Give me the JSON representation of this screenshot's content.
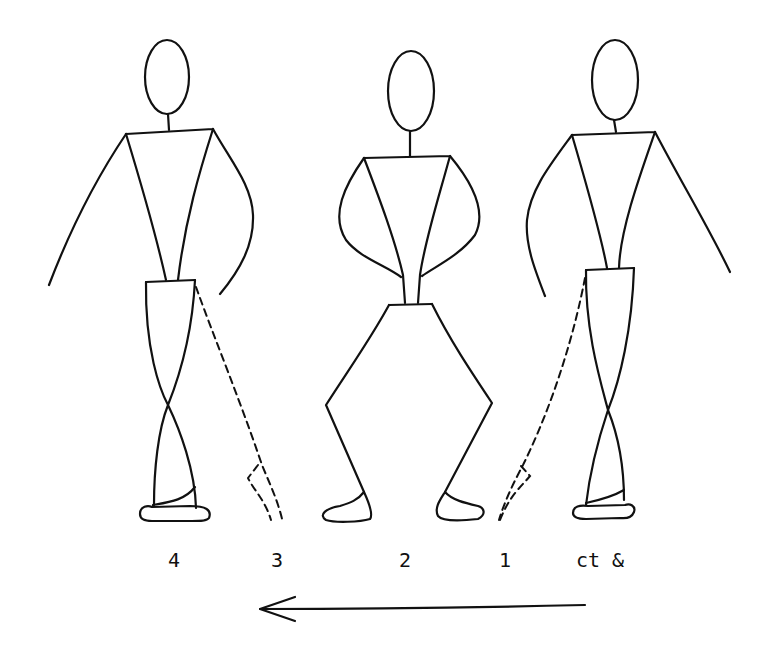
{
  "diagram": {
    "type": "dance step sequence (stick figures)",
    "figures": [
      {
        "position": "left",
        "pose": "legs crossed, right foot front; dashed leg extended to side",
        "count": "4"
      },
      {
        "position": "middle",
        "pose": "plié in second position, hands on hips",
        "count": "2"
      },
      {
        "position": "right",
        "pose": "legs crossed; dashed leg extended to side",
        "count": "ct &"
      }
    ],
    "counts": [
      {
        "label": "4",
        "x": 174
      },
      {
        "label": "3",
        "x": 277
      },
      {
        "label": "2",
        "x": 405
      },
      {
        "label": "1",
        "x": 505
      },
      {
        "label": "ct &",
        "x": 600
      }
    ],
    "arrow": {
      "direction": "left",
      "x_start": 585,
      "x_end": 258,
      "y": 608
    },
    "colors": {
      "ink": "#111111",
      "background": "#ffffff"
    }
  }
}
